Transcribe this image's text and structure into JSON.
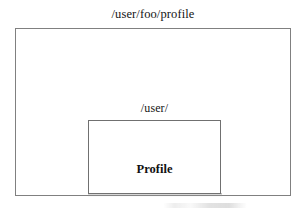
{
  "diagram": {
    "type": "nested-rectangles",
    "outer": {
      "label": "/user/foo/profile",
      "label_position": "above-centered"
    },
    "inner": {
      "label": "/user/",
      "label_position": "above-centered",
      "content": "Profile"
    }
  },
  "colors": {
    "background": "#ffffff",
    "outer_border": "#808080",
    "inner_border": "#707070",
    "text": "#141414"
  }
}
